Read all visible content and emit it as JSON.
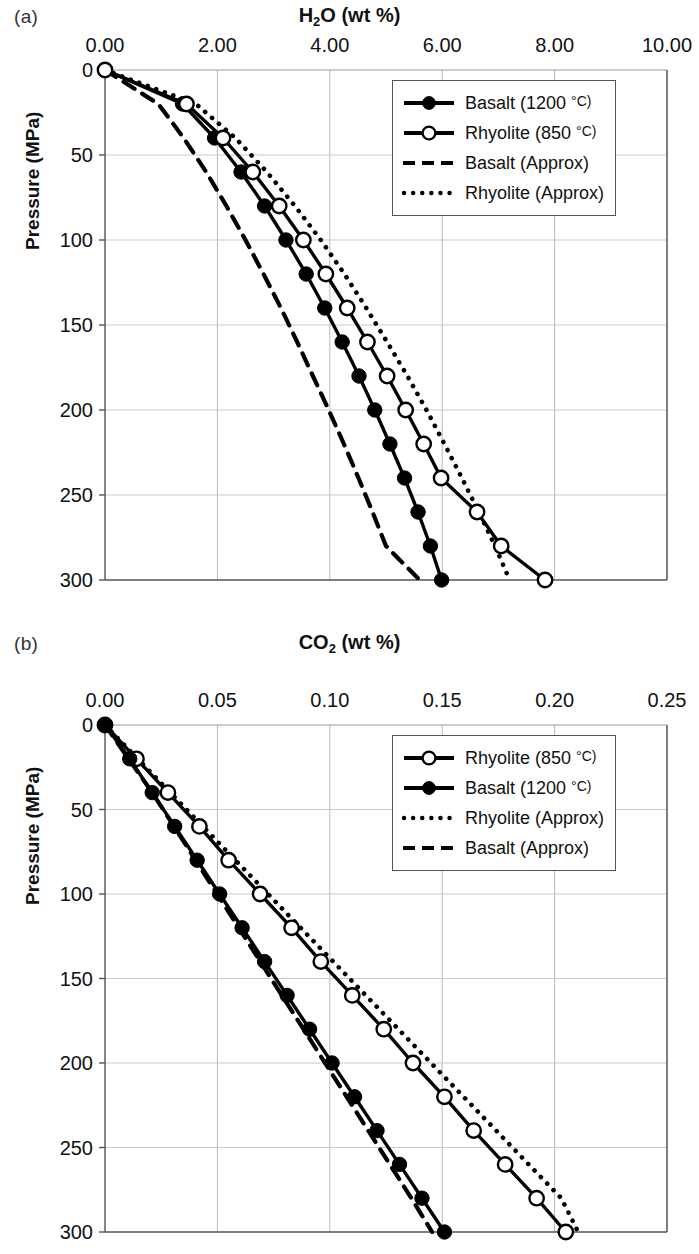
{
  "figure": {
    "panels": [
      {
        "letter": "(a)",
        "axis_title_main": "H",
        "axis_title_sub": "2",
        "axis_title_rest": "O (wt %)",
        "ylabel": "Pressure (MPa)",
        "legend": [
          {
            "label": "Basalt (1200 ",
            "deg": "°C)",
            "style": "line-filled"
          },
          {
            "label": "Rhyolite (850 ",
            "deg": "°C)",
            "style": "line-open"
          },
          {
            "label": "Basalt (Approx)",
            "deg": "",
            "style": "dashed"
          },
          {
            "label": "Rhyolite (Approx)",
            "deg": "",
            "style": "dotted"
          }
        ]
      },
      {
        "letter": "(b)",
        "axis_title_main": "CO",
        "axis_title_sub": "2",
        "axis_title_rest": " (wt %)",
        "ylabel": "Pressure (MPa)",
        "legend": [
          {
            "label": "Rhyolite (850 ",
            "deg": "°C)",
            "style": "line-open"
          },
          {
            "label": "Basalt (1200 ",
            "deg": "°C)",
            "style": "line-filled"
          },
          {
            "label": "Rhyolite (Approx)",
            "deg": "",
            "style": "dotted"
          },
          {
            "label": "Basalt (Approx)",
            "deg": "",
            "style": "dashed"
          }
        ]
      }
    ]
  },
  "chart_data": [
    {
      "type": "line",
      "panel": "(a)",
      "title": "H2O (wt %)",
      "xlabel": "H2O (wt %)",
      "ylabel": "Pressure (MPa)",
      "xlim": [
        0.0,
        10.0
      ],
      "ylim": [
        300,
        0
      ],
      "y_inverted": true,
      "xticks": [
        "0.00",
        "2.00",
        "4.00",
        "6.00",
        "8.00",
        "10.00"
      ],
      "xtick_values": [
        0.0,
        2.0,
        4.0,
        6.0,
        8.0,
        10.0
      ],
      "yticks": [
        "0",
        "50",
        "100",
        "150",
        "200",
        "250",
        "300"
      ],
      "ytick_values": [
        0,
        50,
        100,
        150,
        200,
        250,
        300
      ],
      "grid": true,
      "legend_position": "upper right",
      "pressure": [
        0,
        20,
        40,
        60,
        80,
        100,
        120,
        140,
        160,
        180,
        200,
        220,
        240,
        260,
        280,
        300
      ],
      "series": [
        {
          "name": "Basalt (1200 °C)",
          "style": "solid",
          "marker": "filled-circle",
          "values": [
            0.0,
            1.38,
            1.95,
            2.42,
            2.84,
            3.22,
            3.58,
            3.91,
            4.22,
            4.52,
            4.8,
            5.07,
            5.33,
            5.57,
            5.79,
            5.99
          ]
        },
        {
          "name": "Rhyolite (850 °C)",
          "style": "solid",
          "marker": "open-circle",
          "values": [
            0.0,
            1.45,
            2.1,
            2.63,
            3.1,
            3.53,
            3.93,
            4.31,
            4.67,
            5.02,
            5.35,
            5.67,
            5.98,
            6.62,
            7.05,
            7.83
          ]
        },
        {
          "name": "Basalt (Approx)",
          "style": "dashed",
          "marker": "none",
          "values": [
            0.0,
            0.95,
            1.4,
            1.8,
            2.16,
            2.5,
            2.82,
            3.13,
            3.42,
            3.7,
            3.98,
            4.25,
            4.51,
            4.76,
            5.0,
            5.6
          ]
        },
        {
          "name": "Rhyolite (Approx)",
          "style": "dotted",
          "marker": "none",
          "values": [
            0.0,
            1.62,
            2.32,
            2.88,
            3.38,
            3.84,
            4.26,
            4.65,
            5.02,
            5.38,
            5.72,
            6.04,
            6.35,
            6.65,
            6.94,
            7.2
          ]
        }
      ]
    },
    {
      "type": "line",
      "panel": "(b)",
      "title": "CO2 (wt %)",
      "xlabel": "CO2 (wt %)",
      "ylabel": "Pressure (MPa)",
      "xlim": [
        0.0,
        0.25
      ],
      "ylim": [
        300,
        0
      ],
      "y_inverted": true,
      "xticks": [
        "0.00",
        "0.05",
        "0.10",
        "0.15",
        "0.20",
        "0.25"
      ],
      "xtick_values": [
        0.0,
        0.05,
        0.1,
        0.15,
        0.2,
        0.25
      ],
      "yticks": [
        "0",
        "50",
        "100",
        "150",
        "200",
        "250",
        "300"
      ],
      "ytick_values": [
        0,
        50,
        100,
        150,
        200,
        250,
        300
      ],
      "grid": true,
      "legend_position": "upper right",
      "pressure": [
        0,
        20,
        40,
        60,
        80,
        100,
        120,
        140,
        160,
        180,
        200,
        220,
        240,
        260,
        280,
        300
      ],
      "series": [
        {
          "name": "Rhyolite (850 °C)",
          "style": "solid",
          "marker": "open-circle",
          "values": [
            0.0,
            0.014,
            0.028,
            0.042,
            0.055,
            0.069,
            0.083,
            0.096,
            0.11,
            0.124,
            0.137,
            0.151,
            0.164,
            0.178,
            0.192,
            0.205
          ]
        },
        {
          "name": "Basalt (1200 °C)",
          "style": "solid",
          "marker": "filled-circle",
          "values": [
            0.0,
            0.011,
            0.021,
            0.031,
            0.041,
            0.051,
            0.061,
            0.071,
            0.081,
            0.091,
            0.101,
            0.111,
            0.121,
            0.131,
            0.141,
            0.151
          ]
        },
        {
          "name": "Rhyolite (Approx)",
          "style": "dotted",
          "marker": "none",
          "values": [
            0.0,
            0.0145,
            0.029,
            0.0435,
            0.058,
            0.0725,
            0.087,
            0.1015,
            0.116,
            0.1305,
            0.145,
            0.1595,
            0.174,
            0.1885,
            0.203,
            0.2105
          ]
        },
        {
          "name": "Basalt (Approx)",
          "style": "dashed",
          "marker": "none",
          "values": [
            0.0,
            0.0105,
            0.021,
            0.0307,
            0.0403,
            0.0499,
            0.0595,
            0.0691,
            0.0787,
            0.0883,
            0.0979,
            0.1075,
            0.1171,
            0.1267,
            0.1363,
            0.1455
          ]
        }
      ]
    }
  ]
}
